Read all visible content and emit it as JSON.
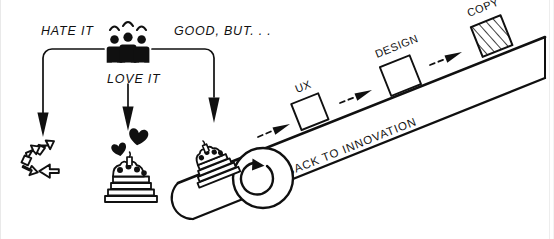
{
  "diagram": {
    "style": "hand-drawn black ink sketch on white",
    "background_color": "#ffffff",
    "ink_color": "#101010",
    "labels": {
      "hate_it": "HATE IT",
      "love_it": "LOVE IT",
      "good_but": "GOOD, BUT. . .",
      "belt": "BACK TO INNOVATION",
      "box_ux": "UX",
      "box_design": "DESIGN",
      "box_copy": "COPY"
    },
    "icons": {
      "people": "three-people-icon",
      "recycle": "recycle-icon",
      "hearts": "hearts-icon",
      "cake_trash": "cake-icon",
      "cake_belt": "cake-icon",
      "pulley": "pulley-rotation-icon"
    },
    "nodes": [
      {
        "id": "audience",
        "name": "three-people-icon",
        "label": "",
        "x": 127,
        "y": 38
      },
      {
        "id": "reject",
        "name": "recycle-icon",
        "label": "HATE IT",
        "x": 38,
        "y": 163
      },
      {
        "id": "ship",
        "name": "cake-icon",
        "label": "LOVE IT",
        "x": 130,
        "y": 172
      },
      {
        "id": "iterate",
        "name": "cake-icon",
        "label": "GOOD, BUT. . .",
        "x": 210,
        "y": 152
      },
      {
        "id": "ux",
        "name": "ux-box",
        "label": "UX",
        "x": 310,
        "y": 110
      },
      {
        "id": "design",
        "name": "design-box",
        "label": "DESIGN",
        "x": 401,
        "y": 75
      },
      {
        "id": "copy",
        "name": "copy-box",
        "label": "COPY",
        "x": 492,
        "y": 35
      }
    ],
    "flows": [
      {
        "from": "audience",
        "to": "reject",
        "label": "HATE IT"
      },
      {
        "from": "audience",
        "to": "ship",
        "label": "LOVE IT"
      },
      {
        "from": "audience",
        "to": "iterate",
        "label": "GOOD, BUT. . ."
      },
      {
        "from": "iterate",
        "to": "ux",
        "label": ""
      },
      {
        "from": "ux",
        "to": "design",
        "label": ""
      },
      {
        "from": "design",
        "to": "copy",
        "label": ""
      }
    ]
  }
}
